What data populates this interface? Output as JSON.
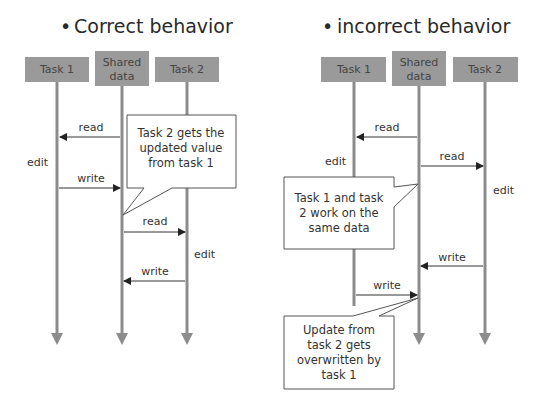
{
  "panels": [
    {
      "title": "Correct behavior",
      "bullet": "•",
      "participants": [
        {
          "label": "Task 1"
        },
        {
          "label_line1": "Shared",
          "label_line2": "data"
        },
        {
          "label": "Task 2"
        }
      ],
      "messages": [
        {
          "label": "read",
          "from": "Shared data",
          "to": "Task 1"
        },
        {
          "label": "write",
          "from": "Task 1",
          "to": "Shared data"
        },
        {
          "label": "read",
          "from": "Shared data",
          "to": "Task 2"
        },
        {
          "label": "write",
          "from": "Task 2",
          "to": "Shared data"
        }
      ],
      "edits": [
        "edit",
        "edit"
      ],
      "notes": [
        {
          "lines": [
            "Task 2 gets the",
            "updated value",
            "from task 1"
          ]
        }
      ]
    },
    {
      "title": "incorrect behavior",
      "bullet": "•",
      "participants": [
        {
          "label": "Task 1"
        },
        {
          "label_line1": "Shared",
          "label_line2": "data"
        },
        {
          "label": "Task 2"
        }
      ],
      "messages": [
        {
          "label": "read",
          "from": "Shared data",
          "to": "Task 1"
        },
        {
          "label": "read",
          "from": "Shared data",
          "to": "Task 2"
        },
        {
          "label": "write",
          "from": "Task 2",
          "to": "Shared data"
        },
        {
          "label": "write",
          "from": "Task 1",
          "to": "Shared data"
        }
      ],
      "edits": [
        "edit",
        "edit"
      ],
      "notes": [
        {
          "lines": [
            "Task 1 and task",
            "2 work on the",
            "same data"
          ]
        },
        {
          "lines": [
            "Update from",
            "task 2 gets",
            "overwritten by",
            "task 1"
          ]
        }
      ]
    }
  ],
  "colors": {
    "participant_fill": "#9a9a9a",
    "lifeline": "#8c8c8c",
    "arrow": "#333333",
    "note_border": "#555555"
  }
}
